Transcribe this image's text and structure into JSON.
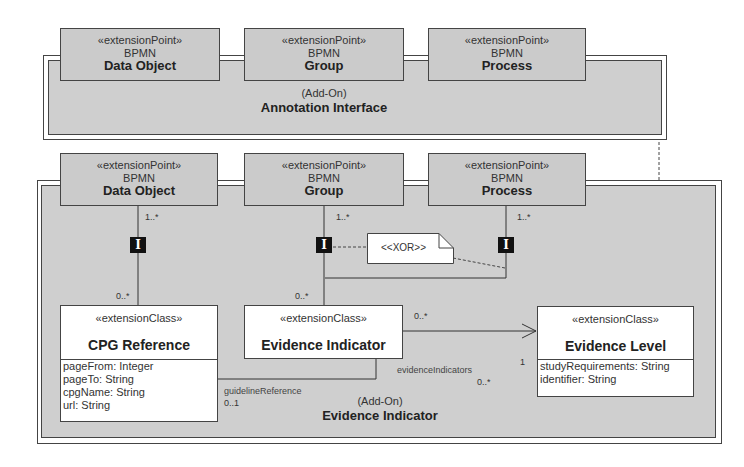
{
  "annotation_interface": {
    "addon_label": "(Add-On)",
    "title": "Annotation Interface",
    "extension_points": [
      {
        "stereotype": "«extensionPoint»",
        "package": "BPMN",
        "name": "Data Object"
      },
      {
        "stereotype": "«extensionPoint»",
        "package": "BPMN",
        "name": "Group"
      },
      {
        "stereotype": "«extensionPoint»",
        "package": "BPMN",
        "name": "Process"
      }
    ]
  },
  "evidence_indicator_addon": {
    "addon_label": "(Add-On)",
    "title": "Evidence Indicator",
    "extension_points": [
      {
        "stereotype": "«extensionPoint»",
        "package": "BPMN",
        "name": "Data Object"
      },
      {
        "stereotype": "«extensionPoint»",
        "package": "BPMN",
        "name": "Group"
      },
      {
        "stereotype": "«extensionPoint»",
        "package": "BPMN",
        "name": "Process"
      }
    ],
    "classes": {
      "cpg_reference": {
        "stereotype": "«extensionClass»",
        "name": "CPG Reference",
        "attributes": [
          "pageFrom: Integer",
          "pageTo: String",
          "cpgName: String",
          "url: String"
        ]
      },
      "evidence_indicator": {
        "stereotype": "«extensionClass»",
        "name": "Evidence Indicator"
      },
      "evidence_level": {
        "stereotype": "«extensionClass»",
        "name": "Evidence Level",
        "attributes": [
          "studyRequirements: String",
          "identifier: String"
        ]
      }
    },
    "multiplicities": {
      "data_object_top": "1..*",
      "data_object_bottom": "0..*",
      "group_top": "1..*",
      "group_bottom": "0..*",
      "process_top": "1..*",
      "indicator_to_level_source": "0..*",
      "indicator_to_level_target": "1",
      "evidence_indicators_mult": "0..*",
      "guideline_reference_mult": "0..1"
    },
    "roles": {
      "evidence_indicators": "evidenceIndicators",
      "guideline_reference": "guidelineReference"
    },
    "constraint_note": "<<XOR>>",
    "interface_marker": "I"
  }
}
